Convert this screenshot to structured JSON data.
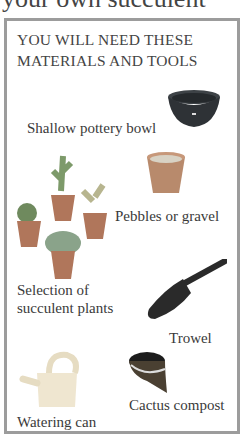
{
  "page": {
    "cut_heading": "your own succulent"
  },
  "box": {
    "title_line1": "YOU WILL NEED THESE",
    "title_line2": "MATERIALS AND TOOLS",
    "items": [
      {
        "label": "Shallow pottery bowl",
        "icon": "pottery-bowl-icon"
      },
      {
        "label": "Pebbles or gravel",
        "icon": "gravel-pot-icon"
      },
      {
        "label_line1": "Selection of",
        "label_line2": "succulent plants",
        "icon": "succulent-plants-icon"
      },
      {
        "label": "Trowel",
        "icon": "trowel-icon"
      },
      {
        "label": "Watering can",
        "icon": "watering-can-icon"
      },
      {
        "label": "Cactus compost",
        "icon": "compost-bag-icon"
      }
    ]
  },
  "colors": {
    "border": "#9c9c9c",
    "text": "#3a3a3a",
    "bowl": "#2e3236",
    "pot": "#b88a6c",
    "leaf": "#7d9a6a",
    "trowel": "#2a2a2a",
    "can": "#efe6d0"
  }
}
